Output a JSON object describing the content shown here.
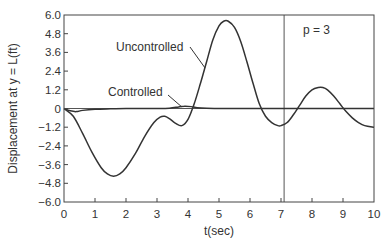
{
  "chart_data": {
    "type": "line",
    "title": "",
    "xlabel": "t(sec)",
    "ylabel": "Displacement at y = L(ft)",
    "xlim": [
      0,
      10
    ],
    "ylim": [
      -6.0,
      6.0
    ],
    "xticks": [
      0,
      1,
      2,
      3,
      4,
      5,
      6,
      7,
      8,
      9,
      10
    ],
    "xtick_labels": [
      "0",
      "1",
      "2",
      "3",
      "4",
      "5",
      "6",
      "7",
      "8",
      "9",
      "10"
    ],
    "yticks": [
      -6.0,
      -4.8,
      -3.6,
      -2.4,
      -1.2,
      0,
      1.2,
      2.4,
      3.6,
      4.8,
      6.0
    ],
    "ytick_labels": [
      "−6.0",
      "−4.8",
      "−3.6",
      "−2.4",
      "−1.2",
      "0",
      "1.2",
      "2.4",
      "3.6",
      "4.8",
      "6.0"
    ],
    "grid": false,
    "reference_lines": {
      "horizontal_y": 0,
      "vertical_x": 7.1
    },
    "annotations": [
      {
        "text": "Uncontrolled",
        "points_to_series": "Uncontrolled",
        "at": [
          4.55,
          2.6
        ]
      },
      {
        "text": "Controlled",
        "points_to_series": "Controlled",
        "at": [
          3.8,
          0.1
        ]
      },
      {
        "text": "p = 3",
        "at": [
          8.2,
          4.8
        ]
      }
    ],
    "series": [
      {
        "name": "Uncontrolled",
        "color": "#333333",
        "x": [
          0,
          0.3,
          0.6,
          0.9,
          1.2,
          1.4,
          1.6,
          1.8,
          2.0,
          2.3,
          2.6,
          2.9,
          3.1,
          3.25,
          3.4,
          3.6,
          3.8,
          4.0,
          4.2,
          4.4,
          4.6,
          4.8,
          5.0,
          5.15,
          5.3,
          5.5,
          5.7,
          5.9,
          6.1,
          6.3,
          6.5,
          6.7,
          6.9,
          7.0,
          7.2,
          7.4,
          7.6,
          7.8,
          8.0,
          8.2,
          8.35,
          8.5,
          8.7,
          8.9,
          9.1,
          9.3,
          9.5,
          9.7,
          10.0
        ],
        "y": [
          0,
          -0.5,
          -1.6,
          -2.8,
          -3.8,
          -4.2,
          -4.35,
          -4.2,
          -3.8,
          -2.9,
          -1.8,
          -0.9,
          -0.55,
          -0.5,
          -0.65,
          -0.95,
          -1.1,
          -0.7,
          0.3,
          1.6,
          3.0,
          4.4,
          5.3,
          5.6,
          5.6,
          5.2,
          4.3,
          3.0,
          1.6,
          0.3,
          -0.5,
          -0.9,
          -1.1,
          -1.1,
          -0.9,
          -0.4,
          0.2,
          0.8,
          1.2,
          1.35,
          1.35,
          1.2,
          0.8,
          0.3,
          -0.2,
          -0.6,
          -0.9,
          -1.1,
          -1.2
        ]
      },
      {
        "name": "Controlled",
        "color": "#333333",
        "x": [
          0,
          0.2,
          0.4,
          0.6,
          1.0,
          1.5,
          2.0,
          2.5,
          3.0,
          3.4,
          3.7,
          3.9,
          4.1,
          4.3,
          4.6,
          5.0,
          6.0,
          7.0,
          8.0,
          9.0,
          10.0
        ],
        "y": [
          0,
          -0.15,
          -0.2,
          -0.12,
          -0.05,
          -0.02,
          0,
          0,
          0,
          0.02,
          0.1,
          0.15,
          0.12,
          0.05,
          0.01,
          0,
          0,
          0,
          0,
          0,
          0
        ]
      }
    ]
  }
}
